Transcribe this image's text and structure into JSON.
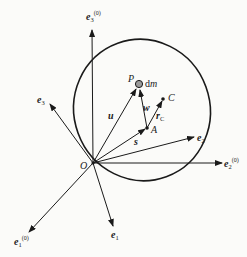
{
  "diagram": {
    "origin_label": "O",
    "inertial_axes": [
      {
        "id": "e1_0",
        "base": "e",
        "sub": "1",
        "sup": "(0)"
      },
      {
        "id": "e2_0",
        "base": "e",
        "sub": "2",
        "sup": "(0)"
      },
      {
        "id": "e3_0",
        "base": "e",
        "sub": "3",
        "sup": "(0)"
      }
    ],
    "body_axes": [
      {
        "id": "e1",
        "base": "e",
        "sub": "1"
      },
      {
        "id": "e2",
        "base": "e",
        "sub": "2"
      },
      {
        "id": "e3",
        "base": "e",
        "sub": "3"
      }
    ],
    "points": {
      "P": "P",
      "A": "A",
      "C": "C",
      "mass_element": "dm"
    },
    "vectors": {
      "u": "u",
      "s": "s",
      "w": "w",
      "rC_base": "r",
      "rC_sub": "C"
    },
    "colors": {
      "line": "#1a1a1a",
      "mass_fill": "#9a9a9a",
      "background": "#fbfbf9"
    }
  }
}
